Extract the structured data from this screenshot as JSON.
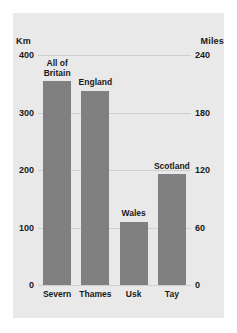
{
  "chart_data": {
    "type": "bar",
    "title": "",
    "subtitle": "",
    "categories": [
      "Severn",
      "Thames",
      "Usk",
      "Tay"
    ],
    "values": [
      354,
      338,
      110,
      193
    ],
    "annotations": [
      "All of\nBritain",
      "England",
      "Wales",
      "Scotland"
    ],
    "xlabel": "",
    "ylabel": "Km",
    "ylabel_right": "Miles",
    "ylim": [
      0,
      400
    ],
    "ylim_right": [
      0,
      240
    ],
    "yticks": [
      0,
      100,
      200,
      300,
      400
    ],
    "yticks_right": [
      0,
      60,
      120,
      180,
      240
    ],
    "grid": true,
    "legend": "none",
    "bar_color": "#808080",
    "panel_color": "#e9e9e9",
    "gridline_color": "#cfcfcf",
    "text_color": "#1a1a1a"
  },
  "axes": {
    "left_title": "Km",
    "right_title": "Miles",
    "left_ticks": [
      "400",
      "300",
      "200",
      "100",
      "0"
    ],
    "right_ticks": [
      "240",
      "180",
      "120",
      "60",
      "0"
    ]
  },
  "bars": [
    {
      "category": "Severn",
      "value": 354,
      "annotation": "All of\nBritain"
    },
    {
      "category": "Thames",
      "value": 338,
      "annotation": "England"
    },
    {
      "category": "Usk",
      "value": 110,
      "annotation": "Wales"
    },
    {
      "category": "Tay",
      "value": 193,
      "annotation": "Scotland"
    }
  ]
}
